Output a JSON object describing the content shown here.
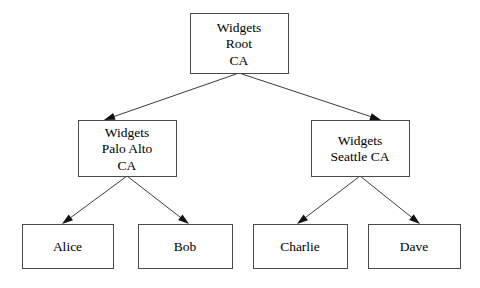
{
  "diagram": {
    "type": "organization-tree",
    "background_color": "#ffffff",
    "line_color": "#3c3c3c",
    "box_border_color": "#4a4a4a",
    "box_fill_color": "#ffffff",
    "text_color": "#000000",
    "nodes": [
      {
        "id": "root",
        "lines": [
          "Widgets",
          "Root",
          "CA"
        ],
        "x": 190,
        "y": 13,
        "w": 98,
        "h": 60,
        "level": 0
      },
      {
        "id": "palo-alto",
        "lines": [
          "Widgets",
          "Palo Alto",
          "CA"
        ],
        "x": 78,
        "y": 120,
        "w": 98,
        "h": 56,
        "level": 1
      },
      {
        "id": "seattle",
        "lines": [
          "Widgets",
          "Seattle CA"
        ],
        "x": 311,
        "y": 120,
        "w": 98,
        "h": 56,
        "level": 1
      },
      {
        "id": "alice",
        "lines": [
          "Alice"
        ],
        "x": 22,
        "y": 224,
        "w": 91,
        "h": 44,
        "level": 2
      },
      {
        "id": "bob",
        "lines": [
          "Bob"
        ],
        "x": 138,
        "y": 224,
        "w": 94,
        "h": 44,
        "level": 2
      },
      {
        "id": "charlie",
        "lines": [
          "Charlie"
        ],
        "x": 253,
        "y": 224,
        "w": 94,
        "h": 44,
        "level": 2
      },
      {
        "id": "dave",
        "lines": [
          "Dave"
        ],
        "x": 368,
        "y": 224,
        "w": 92,
        "h": 44,
        "level": 2
      }
    ],
    "edges": [
      {
        "from": "root",
        "to": "palo-alto",
        "x1": 239,
        "y1": 73,
        "x2": 104,
        "y2": 120
      },
      {
        "from": "root",
        "to": "seattle",
        "x1": 239,
        "y1": 73,
        "x2": 381,
        "y2": 120
      },
      {
        "from": "palo-alto",
        "to": "alice",
        "x1": 127,
        "y1": 176,
        "x2": 62,
        "y2": 224
      },
      {
        "from": "palo-alto",
        "to": "bob",
        "x1": 127,
        "y1": 176,
        "x2": 189,
        "y2": 224
      },
      {
        "from": "seattle",
        "to": "charlie",
        "x1": 360,
        "y1": 176,
        "x2": 297,
        "y2": 224
      },
      {
        "from": "seattle",
        "to": "dave",
        "x1": 360,
        "y1": 176,
        "x2": 420,
        "y2": 224
      }
    ]
  }
}
